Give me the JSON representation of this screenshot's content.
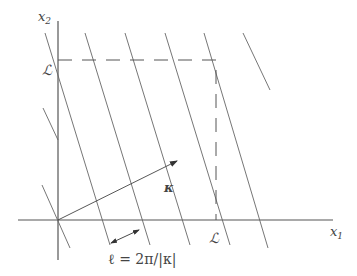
{
  "figure": {
    "axis_x_label": "x",
    "axis_x_sub": "1",
    "axis_y_label": "x",
    "axis_y_sub": "2",
    "period_label_x": "ℒ",
    "period_label_y": "ℒ",
    "wavevector_label": "κ",
    "wavelength_label": "ℓ = 2π/|κ|",
    "colors": {
      "stroke": "#555555",
      "text": "#444444"
    }
  }
}
